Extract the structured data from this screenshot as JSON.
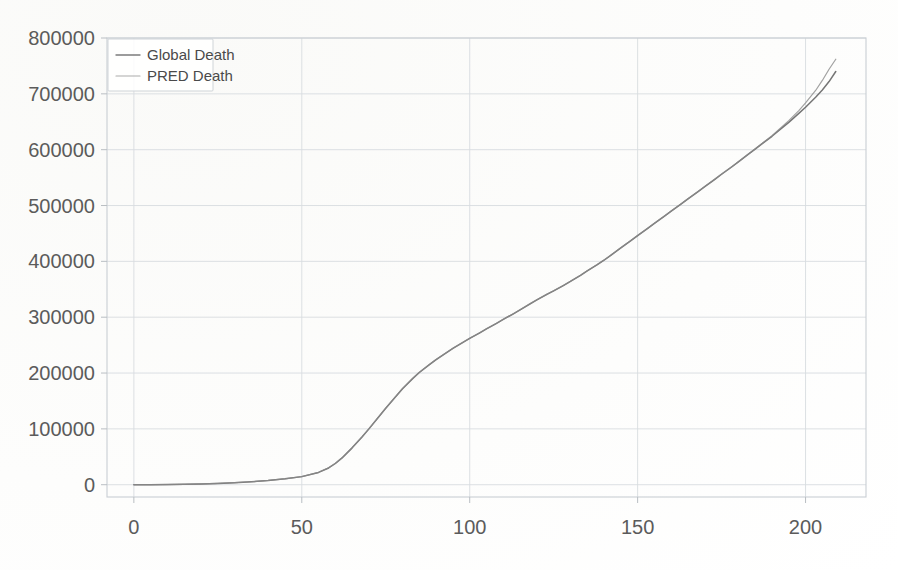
{
  "chart_data": {
    "type": "line",
    "title": "",
    "xlabel": "",
    "ylabel": "",
    "xlim": [
      -8,
      218
    ],
    "ylim": [
      -22000,
      800000
    ],
    "grid": true,
    "legend_position": "upper left",
    "x_ticks": [
      "0",
      "50",
      "100",
      "150",
      "200"
    ],
    "x_tick_values": [
      0,
      50,
      100,
      150,
      200
    ],
    "y_ticks": [
      "0",
      "100000",
      "200000",
      "300000",
      "400000",
      "500000",
      "600000",
      "700000",
      "800000"
    ],
    "y_tick_values": [
      0,
      100000,
      200000,
      300000,
      400000,
      500000,
      600000,
      700000,
      800000
    ],
    "series": [
      {
        "name": "Global Death",
        "color": "#6e6e6e",
        "x": [
          0,
          5,
          10,
          15,
          20,
          25,
          30,
          35,
          40,
          45,
          50,
          55,
          58,
          60,
          62,
          65,
          68,
          70,
          73,
          75,
          78,
          80,
          83,
          85,
          88,
          90,
          93,
          95,
          98,
          100,
          103,
          105,
          108,
          110,
          113,
          115,
          118,
          120,
          123,
          125,
          128,
          130,
          133,
          135,
          138,
          140,
          143,
          145,
          148,
          150,
          153,
          155,
          158,
          160,
          163,
          165,
          168,
          170,
          173,
          175,
          178,
          180,
          183,
          185,
          188,
          190,
          193,
          195,
          198,
          200,
          203,
          205,
          207,
          209
        ],
        "values": [
          0,
          100,
          300,
          700,
          1300,
          2200,
          3500,
          5200,
          7500,
          10500,
          14500,
          22000,
          30000,
          38000,
          48000,
          66000,
          86000,
          100000,
          122000,
          137000,
          158000,
          172000,
          190000,
          201000,
          215000,
          224000,
          236000,
          244000,
          255000,
          262000,
          272000,
          279000,
          289000,
          296000,
          306000,
          313000,
          324000,
          331000,
          341000,
          347000,
          357000,
          364000,
          375000,
          383000,
          394000,
          402000,
          415000,
          424000,
          437000,
          446000,
          459000,
          468000,
          481000,
          490000,
          503000,
          512000,
          525000,
          534000,
          547000,
          556000,
          569000,
          578000,
          592000,
          601000,
          615000,
          624000,
          639000,
          649000,
          665000,
          676000,
          694000,
          707000,
          722000,
          740000
        ]
      },
      {
        "name": "PRED Death",
        "color": "#8a8a8a",
        "x": [
          0,
          5,
          10,
          15,
          20,
          25,
          30,
          35,
          40,
          45,
          50,
          55,
          58,
          60,
          62,
          65,
          68,
          70,
          73,
          75,
          78,
          80,
          83,
          85,
          88,
          90,
          93,
          95,
          98,
          100,
          103,
          105,
          108,
          110,
          113,
          115,
          118,
          120,
          123,
          125,
          128,
          130,
          133,
          135,
          138,
          140,
          143,
          145,
          148,
          150,
          153,
          155,
          158,
          160,
          163,
          165,
          168,
          170,
          173,
          175,
          178,
          180,
          183,
          185,
          188,
          190,
          193,
          195,
          198,
          200,
          203,
          205,
          207,
          209
        ],
        "values": [
          0,
          120,
          320,
          720,
          1350,
          2250,
          3600,
          5300,
          7600,
          10600,
          14600,
          22200,
          30300,
          38300,
          48400,
          66300,
          86300,
          100300,
          122300,
          137300,
          158300,
          172300,
          190300,
          201300,
          215300,
          224300,
          236300,
          244300,
          255300,
          262300,
          272300,
          279300,
          289300,
          296300,
          306300,
          313300,
          324300,
          331300,
          341300,
          347300,
          357300,
          364300,
          375300,
          383300,
          394300,
          402300,
          415300,
          424300,
          437300,
          446300,
          459300,
          468300,
          481300,
          490300,
          503300,
          512300,
          525300,
          534300,
          547300,
          556300,
          569300,
          578300,
          592300,
          601500,
          615500,
          625000,
          641000,
          652000,
          670000,
          684000,
          706000,
          724000,
          744000,
          762000
        ]
      }
    ]
  },
  "legend": {
    "entries": [
      {
        "label": "Global Death"
      },
      {
        "label": "PRED Death"
      }
    ]
  }
}
